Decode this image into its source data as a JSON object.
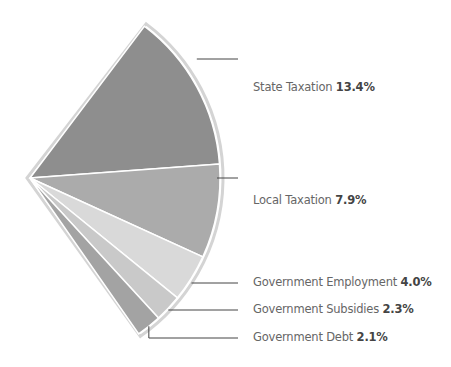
{
  "chart_data": {
    "type": "pie",
    "title": "",
    "categories": [
      "State Taxation",
      "Local Taxation",
      "Government Employment",
      "Government Subsidies",
      "Government Debt"
    ],
    "values": [
      13.4,
      7.9,
      4.0,
      2.3,
      2.1
    ],
    "unit": "%",
    "colors": [
      "#8e8e8e",
      "#ababab",
      "#d9d9d9",
      "#c9c9c9",
      "#a3a3a3"
    ],
    "legend_position": "right, leader lines",
    "labels": [
      {
        "name": "State Taxation",
        "value": "13.4%"
      },
      {
        "name": "Local Taxation",
        "value": "7.9%"
      },
      {
        "name": "Government Employment",
        "value": "4.0%"
      },
      {
        "name": "Government Subsidies",
        "value": "2.3%"
      },
      {
        "name": "Government Debt",
        "value": "2.1%"
      }
    ]
  }
}
